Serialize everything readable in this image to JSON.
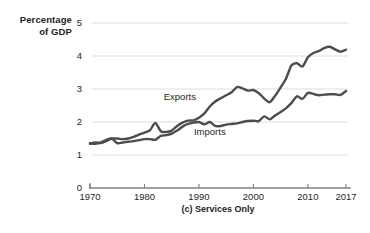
{
  "chart_data": {
    "type": "line",
    "title": "",
    "caption": "(c) Services Only",
    "ylabel_line1": "Percentage",
    "ylabel_line2": "of GDP",
    "xlabel": "",
    "xlim": [
      1970,
      2017
    ],
    "ylim": [
      0,
      5
    ],
    "y_ticks": [
      0,
      1,
      2,
      3,
      4,
      5
    ],
    "y_tick_labels": [
      "0",
      "1",
      "2",
      "3",
      "4",
      "5"
    ],
    "x_ticks": [
      1970,
      1980,
      1990,
      2000,
      2010,
      2017
    ],
    "x_tick_labels": [
      "1970",
      "1980",
      "1990",
      "2000",
      "2010",
      "2017"
    ],
    "grid": "horizontal",
    "legend_position": "inline",
    "line_color": "#4d4d4d",
    "grid_color": "#d9d9d9",
    "axis_color": "#808080",
    "series": [
      {
        "name": "Exports",
        "label_x": 1986.5,
        "label_y": 2.68,
        "x": [
          1970,
          1971,
          1972,
          1973,
          1974,
          1975,
          1976,
          1977,
          1978,
          1979,
          1980,
          1981,
          1982,
          1983,
          1984,
          1985,
          1986,
          1987,
          1988,
          1989,
          1990,
          1991,
          1992,
          1993,
          1994,
          1995,
          1996,
          1997,
          1998,
          1999,
          2000,
          2001,
          2002,
          2003,
          2004,
          2005,
          2006,
          2007,
          2008,
          2009,
          2010,
          2011,
          2012,
          2013,
          2014,
          2015,
          2016,
          2017
        ],
        "values": [
          1.34,
          1.38,
          1.36,
          1.42,
          1.5,
          1.5,
          1.48,
          1.5,
          1.55,
          1.62,
          1.68,
          1.75,
          1.97,
          1.72,
          1.7,
          1.74,
          1.88,
          1.98,
          2.04,
          2.05,
          2.13,
          2.26,
          2.47,
          2.62,
          2.72,
          2.81,
          2.9,
          3.06,
          3.02,
          2.95,
          2.97,
          2.87,
          2.71,
          2.6,
          2.8,
          3.05,
          3.32,
          3.72,
          3.78,
          3.68,
          3.96,
          4.09,
          4.15,
          4.24,
          4.28,
          4.2,
          4.13,
          4.19
        ]
      },
      {
        "name": "Imports",
        "label_x": 1992.0,
        "label_y": 1.62,
        "x": [
          1970,
          1971,
          1972,
          1973,
          1974,
          1975,
          1976,
          1977,
          1978,
          1979,
          1980,
          1981,
          1982,
          1983,
          1984,
          1985,
          1986,
          1987,
          1988,
          1989,
          1990,
          1991,
          1992,
          1993,
          1994,
          1995,
          1996,
          1997,
          1998,
          1999,
          2000,
          2001,
          2002,
          2003,
          2004,
          2005,
          2006,
          2007,
          2008,
          2009,
          2010,
          2011,
          2012,
          2013,
          2014,
          2015,
          2016,
          2017
        ],
        "values": [
          1.36,
          1.34,
          1.38,
          1.46,
          1.5,
          1.36,
          1.38,
          1.4,
          1.42,
          1.45,
          1.48,
          1.48,
          1.46,
          1.58,
          1.6,
          1.65,
          1.74,
          1.86,
          1.94,
          1.98,
          2.0,
          1.93,
          2.0,
          1.88,
          1.88,
          1.92,
          1.94,
          1.96,
          2.0,
          2.03,
          2.04,
          2.03,
          2.17,
          2.08,
          2.2,
          2.3,
          2.42,
          2.58,
          2.78,
          2.7,
          2.88,
          2.85,
          2.81,
          2.83,
          2.84,
          2.84,
          2.82,
          2.94
        ]
      }
    ]
  },
  "figure": {
    "plot_area": {
      "left": 90,
      "right": 346,
      "top": 23,
      "bottom": 188
    }
  }
}
